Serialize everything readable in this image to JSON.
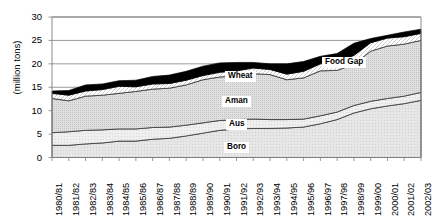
{
  "chart_data": {
    "type": "area",
    "stacked": true,
    "title": "",
    "xlabel": "",
    "ylabel": "(million tons)",
    "ylim": [
      0,
      30
    ],
    "ytick_values": [
      0,
      5,
      10,
      15,
      20,
      25,
      30
    ],
    "ytick_labels": [
      "0",
      "5",
      "10",
      "15",
      "20",
      "25",
      "30"
    ],
    "grid": "horizontal",
    "legend_position": "inline-annotations",
    "categories": [
      "1980/81",
      "1981/82",
      "1982/83",
      "1983/84",
      "1984/85",
      "1985/86",
      "1986/87",
      "1987/88",
      "1988/89",
      "1989/90",
      "1990/91",
      "1991/92",
      "1992/93",
      "1993/94",
      "1994/95",
      "1995/96",
      "1996/97",
      "1997/98",
      "1998/99",
      "1999/00",
      "2000/01",
      "2001/02",
      "2002/03"
    ],
    "series": [
      {
        "name": "Boro",
        "values": [
          2.6,
          2.6,
          2.9,
          3.1,
          3.5,
          3.5,
          3.9,
          4.1,
          4.6,
          5.2,
          5.8,
          6.1,
          6.2,
          6.2,
          6.3,
          6.5,
          7.2,
          8.1,
          9.5,
          10.4,
          11.0,
          11.5,
          12.2
        ]
      },
      {
        "name": "Aus",
        "values": [
          2.7,
          2.9,
          2.9,
          2.8,
          2.6,
          2.6,
          2.5,
          2.4,
          2.3,
          2.2,
          2.1,
          2.0,
          2.0,
          1.9,
          1.8,
          1.7,
          1.7,
          1.6,
          1.6,
          1.6,
          1.6,
          1.6,
          1.7
        ]
      },
      {
        "name": "Aman",
        "values": [
          7.3,
          6.6,
          7.3,
          7.4,
          7.6,
          8.0,
          8.2,
          8.3,
          8.6,
          9.2,
          9.3,
          9.3,
          9.7,
          9.6,
          8.5,
          8.8,
          9.6,
          8.9,
          8.8,
          10.7,
          11.2,
          11.1,
          11.1
        ]
      },
      {
        "name": "Wheat",
        "values": [
          1.1,
          1.2,
          1.1,
          1.2,
          1.5,
          1.0,
          1.1,
          1.0,
          1.0,
          0.9,
          1.0,
          1.1,
          1.2,
          1.1,
          1.2,
          1.4,
          1.5,
          1.8,
          1.9,
          1.8,
          1.7,
          1.6,
          1.5
        ]
      },
      {
        "name": "Food Gap",
        "values": [
          0.5,
          1.0,
          1.3,
          1.2,
          1.2,
          1.4,
          1.6,
          1.8,
          1.9,
          2.0,
          2.0,
          1.8,
          1.2,
          1.2,
          2.2,
          2.1,
          1.6,
          1.8,
          2.6,
          0.9,
          0.6,
          1.0,
          0.9
        ]
      }
    ],
    "annotations": [
      {
        "text": "Food Gap",
        "x": 322,
        "y": 57
      },
      {
        "text": "Wheat",
        "x": 225,
        "y": 71
      },
      {
        "text": "Aman",
        "x": 222,
        "y": 96
      },
      {
        "text": "Aus",
        "x": 226,
        "y": 119
      },
      {
        "text": "Boro",
        "x": 224,
        "y": 142
      }
    ],
    "colors": {
      "boro": "#e3e3e3",
      "aus": "#ededed",
      "aman": "#dcdcdc",
      "wheat": "#ffffff",
      "food_gap": "#000000",
      "axis": "#808080",
      "grid": "#808080",
      "text": "#000000"
    }
  }
}
